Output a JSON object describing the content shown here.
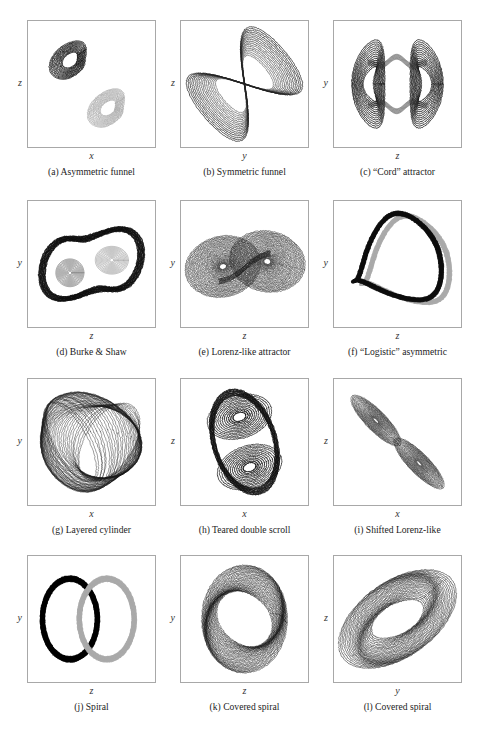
{
  "figure": {
    "kind": "multi-panel-scientific-figure",
    "rows": 4,
    "cols": 3,
    "panel_count": 12,
    "background": "#ffffff",
    "border_color": "#a8a8a8",
    "trace_dark": "#0d0d0d",
    "trace_gray": "#aaaaaa",
    "footer_note": ""
  },
  "chart_data": {
    "type": "line",
    "title": "",
    "xlabel": "",
    "ylabel": "",
    "layout": {
      "grid": false,
      "legend": false,
      "axis_ticks": false,
      "axis_ranges_shown": false
    },
    "panels": [
      {
        "id": "a",
        "label": "(a)",
        "name": "Asymmetric funnel",
        "caption": "(a) Asymmetric funnel",
        "xlabel": "x",
        "ylabel": "z",
        "series": [
          {
            "name": "upper-lobe",
            "color": "#0d0d0d",
            "style": "dense-loops"
          },
          {
            "name": "lower-lobe",
            "color": "#aaaaaa",
            "style": "dense-loops"
          }
        ],
        "description": "Two separated teardrop loop bundles, dark upper-left and light gray lower-right"
      },
      {
        "id": "b",
        "label": "(b)",
        "name": "Symmetric funnel",
        "caption": "(b) Symmetric funnel",
        "xlabel": "y",
        "ylabel": "z",
        "series": [
          {
            "name": "figure-eight",
            "color": "#555555",
            "style": "nested-bands"
          }
        ],
        "description": "Figure-eight / infinity shaped nested band structure crossing at centre"
      },
      {
        "id": "c",
        "label": "(c)",
        "name": "“Cord” attractor",
        "caption": "(c) “Cord” attractor",
        "xlabel": "z",
        "ylabel": "y",
        "series": [
          {
            "name": "left-disc",
            "color": "#111111",
            "style": "flat-rings"
          },
          {
            "name": "right-disc",
            "color": "#111111",
            "style": "flat-rings"
          },
          {
            "name": "connecting-cord",
            "color": "#333333",
            "style": "thin-thread"
          }
        ],
        "description": "Two vertical ring stacks joined by thin wavy cord threads"
      },
      {
        "id": "d",
        "label": "(d)",
        "name": "Burke & Shaw",
        "caption": "(d) Burke & Shaw",
        "xlabel": "z",
        "ylabel": "y",
        "series": [
          {
            "name": "outer-sweep",
            "color": "#0d0d0d",
            "style": "bold-loop"
          },
          {
            "name": "inner-spirals",
            "color": "#666666",
            "style": "tight-spirals"
          }
        ],
        "description": "Two tight inner spiral cores wrapped by a large bold outer loop"
      },
      {
        "id": "e",
        "label": "(e)",
        "name": "Lorenz-like attractor",
        "caption": "(e) Lorenz-like attractor",
        "xlabel": "z",
        "ylabel": "y",
        "series": [
          {
            "name": "left-wing",
            "color": "#222222",
            "style": "dense-spirals"
          },
          {
            "name": "right-wing",
            "color": "#222222",
            "style": "dense-spirals"
          }
        ],
        "description": "Classic butterfly: two dense spiral wings sharing a crossing saddle"
      },
      {
        "id": "f",
        "label": "(f)",
        "name": "“Logistic” asymmetric",
        "caption": "(f) “Logistic” asymmetric",
        "xlabel": "z",
        "ylabel": "y",
        "series": [
          {
            "name": "dark-band",
            "color": "#0d0d0d",
            "style": "thick-ribbon"
          },
          {
            "name": "gray-band",
            "color": "#aaaaaa",
            "style": "thick-ribbon"
          }
        ],
        "description": "Single broad pinched ring; dark ribbon and gray ribbon interleaved"
      },
      {
        "id": "g",
        "label": "(g)",
        "name": "Layered cylinder",
        "caption": "(g) Layered cylinder",
        "xlabel": "x",
        "ylabel": "y",
        "series": [
          {
            "name": "layered-shell",
            "color": "#1a1a1a",
            "style": "crossing-ellipses"
          }
        ],
        "description": "Many crossing tilted ellipses forming a layered barrel / cylinder silhouette"
      },
      {
        "id": "h",
        "label": "(h)",
        "name": "Teared double scroll",
        "caption": "(h) Teared double scroll",
        "xlabel": "x",
        "ylabel": "z",
        "series": [
          {
            "name": "upper-scroll",
            "color": "#111111",
            "style": "open-loops"
          },
          {
            "name": "lower-scroll",
            "color": "#111111",
            "style": "open-loops"
          }
        ],
        "description": "Two large stacked torn loops joined through a narrow waist"
      },
      {
        "id": "i",
        "label": "(i)",
        "name": "Shifted Lorenz-like",
        "caption": "(i) Shifted Lorenz-like",
        "xlabel": "x",
        "ylabel": "z",
        "series": [
          {
            "name": "upper-left-lobe",
            "color": "#1a1a1a",
            "style": "thin-spirals"
          },
          {
            "name": "lower-right-lobe",
            "color": "#1a1a1a",
            "style": "thin-spirals"
          }
        ],
        "description": "Two slender diagonal spiral lobes along the anti-diagonal"
      },
      {
        "id": "j",
        "label": "(j)",
        "name": "Spiral",
        "caption": "(j) Spiral",
        "xlabel": "z",
        "ylabel": "y",
        "series": [
          {
            "name": "left-ring",
            "color": "#000000",
            "style": "thick-ring"
          },
          {
            "name": "right-ring",
            "color": "#aaaaaa",
            "style": "thick-ring"
          }
        ],
        "description": "Two overlapping thick rings, left black and right light gray"
      },
      {
        "id": "k",
        "label": "(k)",
        "name": "Covered spiral",
        "caption": "(k) Covered spiral",
        "xlabel": "z",
        "ylabel": "y",
        "series": [
          {
            "name": "covered-ring",
            "color": "#141414",
            "style": "nested-rings"
          }
        ],
        "description": "Single broad upright ring of many nested rounded loops"
      },
      {
        "id": "l",
        "label": "(l)",
        "name": "Covered spiral",
        "caption": "(l) Covered spiral",
        "xlabel": "y",
        "ylabel": "z",
        "series": [
          {
            "name": "covered-ring-tilted",
            "color": "#141414",
            "style": "nested-rings"
          }
        ],
        "description": "Same covered spiral viewed tilted along the main diagonal"
      }
    ]
  }
}
